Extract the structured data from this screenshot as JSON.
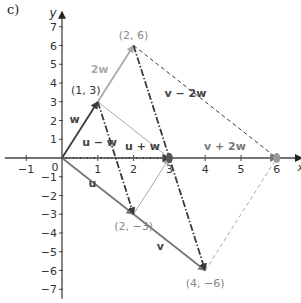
{
  "part_label": "c)",
  "axes": {
    "x_label": "x",
    "y_label": "y",
    "x_range": [
      -1.6,
      6.7
    ],
    "y_range": [
      -7.5,
      7.8
    ],
    "x_ticks": [
      -1,
      1,
      2,
      3,
      4,
      5,
      6
    ],
    "y_ticks": [
      -7,
      -6,
      -5,
      -4,
      -3,
      -2,
      -1,
      1,
      2,
      3,
      4,
      5,
      6,
      7
    ],
    "origin_label": "0"
  },
  "colors": {
    "axis": "#444444",
    "dark": "#3a3a3a",
    "mid": "#777777",
    "light": "#aaaaaa",
    "point_label": "#888888",
    "vector_label": "#555555"
  },
  "segments": [
    {
      "id": "w",
      "from": [
        0,
        0
      ],
      "to": [
        1,
        3
      ],
      "style": "solid",
      "tone": "dark",
      "arrow": true,
      "width": "thick"
    },
    {
      "id": "2w-extension",
      "from": [
        1,
        3
      ],
      "to": [
        2,
        6
      ],
      "style": "solid",
      "tone": "light",
      "arrow": true,
      "width": "thick"
    },
    {
      "id": "u",
      "from": [
        0,
        0
      ],
      "to": [
        2,
        -3
      ],
      "style": "solid",
      "tone": "mid",
      "arrow": true,
      "width": "thick"
    },
    {
      "id": "v-extension",
      "from": [
        2,
        -3
      ],
      "to": [
        4,
        -6
      ],
      "style": "solid",
      "tone": "mid",
      "arrow": true,
      "width": "thick"
    },
    {
      "id": "u-plus-w-top",
      "from": [
        1,
        3
      ],
      "to": [
        3,
        0
      ],
      "style": "solid",
      "tone": "light",
      "arrow": false,
      "width": "thin"
    },
    {
      "id": "u-plus-w-bottom",
      "from": [
        2,
        -3
      ],
      "to": [
        3,
        0
      ],
      "style": "solid",
      "tone": "light",
      "arrow": true,
      "width": "thin"
    },
    {
      "id": "u-minus-w",
      "from": [
        1,
        3
      ],
      "to": [
        2,
        -3
      ],
      "style": "dashdot",
      "tone": "dark",
      "arrow": true,
      "width": "thick"
    },
    {
      "id": "v-minus-2w",
      "from": [
        2,
        6
      ],
      "to": [
        4,
        -6
      ],
      "style": "dashdot",
      "tone": "dark",
      "arrow": true,
      "width": "thick"
    },
    {
      "id": "v-plus-2w-top",
      "from": [
        2,
        6
      ],
      "to": [
        6,
        0
      ],
      "style": "dashed",
      "tone": "dark",
      "arrow": false,
      "width": "thin"
    },
    {
      "id": "v-plus-2w-bottom",
      "from": [
        4,
        -6
      ],
      "to": [
        6,
        0
      ],
      "style": "dashed",
      "tone": "light",
      "arrow": false,
      "width": "thin"
    },
    {
      "id": "u-plus-w-axis",
      "from": [
        0,
        0
      ],
      "to": [
        3,
        0
      ],
      "style": "dotted",
      "tone": "dark",
      "arrow": true,
      "width": "thick"
    },
    {
      "id": "v-plus-2w-axis",
      "from": [
        0,
        0
      ],
      "to": [
        6,
        0
      ],
      "style": "dashed",
      "tone": "mid",
      "arrow": true,
      "width": "thin"
    }
  ],
  "points": [
    {
      "label": "(1, 3)",
      "at": [
        1,
        3
      ],
      "tone": "dark",
      "anchor": "above-left"
    },
    {
      "label": "(2, 6)",
      "at": [
        2,
        6
      ],
      "tone": "light",
      "anchor": "above"
    },
    {
      "label": "(2, −3)",
      "at": [
        2,
        -3
      ],
      "tone": "mid",
      "anchor": "below"
    },
    {
      "label": "(4, −6)",
      "at": [
        4,
        -6
      ],
      "tone": "mid",
      "anchor": "below"
    }
  ],
  "vector_labels": [
    {
      "text": "w",
      "at": [
        0.35,
        1.85
      ],
      "tone": "dark"
    },
    {
      "text": "2w",
      "at": [
        1.05,
        4.55
      ],
      "tone": "light"
    },
    {
      "text": "u",
      "at": [
        0.85,
        -1.55
      ],
      "tone": "dark"
    },
    {
      "text": "v",
      "at": [
        2.75,
        -4.9
      ],
      "tone": "dark"
    },
    {
      "text": "u − w",
      "at": [
        1.05,
        0.65
      ],
      "tone": "dark"
    },
    {
      "text": "u + w",
      "at": [
        2.25,
        0.45
      ],
      "tone": "dark"
    },
    {
      "text": "v − 2w",
      "at": [
        3.45,
        3.25
      ],
      "tone": "dark"
    },
    {
      "text": "v + 2w",
      "at": [
        4.55,
        0.45
      ],
      "tone": "mid"
    }
  ]
}
